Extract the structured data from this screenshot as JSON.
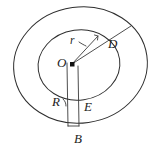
{
  "figure": {
    "type": "geometry-diagram",
    "background_color": "#ffffff",
    "stroke_color": "#2e2e2e",
    "label_color": "#1c1c1c",
    "labels": {
      "center": "O",
      "inner_radius": "r",
      "outer_radius": "D",
      "left_vertical": "R",
      "right_vertical": "E",
      "base": "B"
    },
    "shapes": {
      "outer_ellipse": {
        "name": "outer-ellipse",
        "cx": 80.5,
        "cy": 65,
        "rx": 67,
        "ry": 58,
        "rotation": -8
      },
      "inner_ellipse": {
        "name": "inner-ellipse",
        "cx": 79,
        "cy": 65,
        "rx": 41,
        "ry": 35,
        "rotation": -8
      },
      "center_point": {
        "name": "center-point",
        "x": 72,
        "y": 64,
        "size": 4
      },
      "radius_r_line": {
        "name": "radius-r-line",
        "x1": 72,
        "y1": 64,
        "x2": 98,
        "y2": 36
      },
      "radius_d_line": {
        "name": "radius-d-line",
        "x1": 72,
        "y1": 64,
        "x2": 131,
        "y2": 26
      },
      "left_vertical_line": {
        "name": "left-vertical-line",
        "x1": 67,
        "y1": 63,
        "x2": 68,
        "y2": 126
      },
      "right_vertical_line": {
        "name": "right-vertical-line",
        "x1": 78,
        "y1": 66,
        "x2": 79,
        "y2": 126
      },
      "base_segment": {
        "name": "base-segment",
        "x1": 68,
        "y1": 126,
        "x2": 79,
        "y2": 126
      }
    },
    "label_positions": {
      "center": {
        "x": 60,
        "y": 57
      },
      "inner_radius": {
        "x": 71,
        "y": 36
      },
      "outer_radius": {
        "x": 109,
        "y": 38
      },
      "left_vertical": {
        "x": 53,
        "y": 96
      },
      "right_vertical": {
        "x": 84,
        "y": 101
      },
      "base": {
        "x": 75,
        "y": 133
      }
    }
  }
}
